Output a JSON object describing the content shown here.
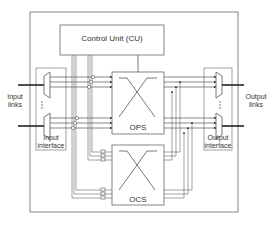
{
  "diagram": {
    "control_unit": {
      "label": "Control Unit (CU)"
    },
    "ops": {
      "label": "OPS"
    },
    "ocs": {
      "label": "OCS"
    },
    "input_interface": {
      "label_line1": "Input",
      "label_line2": "interface"
    },
    "output_interface": {
      "label_line1": "Output",
      "label_line2": "interface"
    },
    "input_links": {
      "label_line1": "Input",
      "label_line2": "links"
    },
    "output_links": {
      "label_line1": "Output",
      "label_line2": "links"
    }
  },
  "colors": {
    "line": "#555555",
    "box": "#666666",
    "background": "#ffffff"
  }
}
